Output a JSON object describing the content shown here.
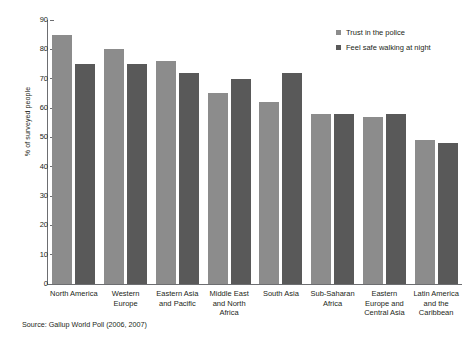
{
  "chart_data": {
    "type": "bar",
    "title": "",
    "xlabel": "",
    "ylabel": "% of surveyed people",
    "ylim": [
      0,
      90
    ],
    "yticks": [
      0,
      10,
      20,
      30,
      40,
      50,
      60,
      70,
      80,
      90
    ],
    "grid": false,
    "legend_position": "top-right",
    "categories": [
      "North America",
      "Western Europe",
      "Eastern Asia and Pacific",
      "Middle East and North Africa",
      "South Asia",
      "Sub-Saharan Africa",
      "Eastern Europe and Central Asia",
      "Latin America and the Caribbean"
    ],
    "series": [
      {
        "name": "Feel safe walking at night",
        "color": "#595959",
        "values": [
          75,
          75,
          72,
          70,
          72,
          58,
          58,
          48
        ]
      },
      {
        "name": "Trust in the police",
        "color": "#8c8c8c",
        "values": [
          85,
          80,
          76,
          65,
          62,
          58,
          57,
          49
        ]
      }
    ],
    "source": "Source: Gallup World Poll (2006, 2007)"
  },
  "legend": {
    "items": [
      {
        "label": "Trust in the police",
        "swatch": "light"
      },
      {
        "label": "Feel safe walking at night",
        "swatch": "dark"
      }
    ]
  },
  "axis": {
    "y_title": "% of surveyed people"
  },
  "footer": {
    "source": "Source: Gallup World Poll (2006, 2007)"
  }
}
